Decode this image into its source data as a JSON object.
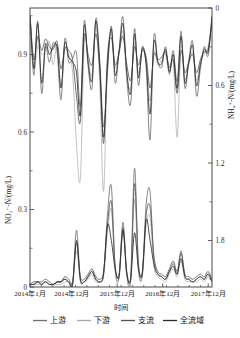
{
  "chart_data": {
    "type": "line",
    "title": "",
    "xlabel": "时间",
    "ylabel_left": "NO₂⁻-N/(mg/L)",
    "ylabel_right": "NH₄⁺-N/(mg/L)",
    "grid": false,
    "legend_position": "bottom",
    "x_tick_labels": [
      "2014年1月",
      "2014年12月",
      "2015年12月",
      "2016年12月",
      "2017年12月"
    ],
    "x_tick_positions": [
      0,
      11,
      23,
      35,
      47
    ],
    "xlim": [
      0,
      48
    ],
    "left_axis": {
      "label": "NO₂⁻-N/(mg/L)",
      "ticks": [
        0,
        0.3,
        0.6,
        0.9
      ],
      "tick_labels": [
        "0",
        "0.3",
        "0.6",
        "0.9"
      ],
      "lim": [
        0,
        1.08
      ],
      "inverted": false
    },
    "right_axis": {
      "label": "NH₄⁺-N/(mg/L)",
      "ticks": [
        0,
        0.6,
        1.2,
        1.8
      ],
      "tick_labels": [
        "0",
        "0.6",
        "1.2",
        "1.8"
      ],
      "lim": [
        0,
        2.16
      ],
      "inverted": true
    },
    "series": [
      {
        "name": "上游",
        "color": "#6f6f6f",
        "axis": "right",
        "values": [
          0.07,
          0.52,
          0.1,
          0.66,
          0.3,
          0.42,
          0.27,
          0.34,
          0.71,
          0.24,
          0.42,
          0.39,
          0.35,
          0.76,
          0.1,
          0.45,
          0.62,
          0.08,
          0.4,
          0.92,
          0.5,
          0.14,
          0.58,
          0.33,
          0.07,
          0.55,
          0.74,
          0.16,
          0.6,
          0.3,
          0.46,
          1.02,
          0.22,
          0.41,
          0.46,
          0.3,
          0.49,
          0.33,
          0.57,
          0.18,
          0.62,
          0.41,
          0.26,
          0.68,
          0.47,
          0.3,
          0.37,
          0.06
        ]
      },
      {
        "name": "下游",
        "color": "#a8a8a8",
        "axis": "right",
        "values": [
          0.05,
          0.46,
          0.3,
          0.36,
          0.33,
          0.26,
          0.44,
          0.28,
          0.6,
          0.33,
          0.36,
          0.5,
          1.05,
          1.32,
          0.28,
          0.4,
          0.52,
          0.14,
          0.58,
          1.42,
          0.4,
          0.2,
          0.46,
          0.36,
          0.18,
          0.52,
          0.62,
          0.27,
          0.5,
          0.34,
          0.4,
          0.72,
          0.34,
          0.44,
          0.4,
          0.36,
          0.52,
          0.42,
          1.0,
          0.3,
          0.55,
          0.44,
          0.34,
          0.56,
          0.42,
          0.36,
          0.3,
          0.1
        ]
      },
      {
        "name": "支流",
        "color": "#555555",
        "axis": "right",
        "values": [
          0.06,
          0.4,
          0.22,
          0.33,
          0.24,
          0.3,
          0.32,
          0.26,
          0.47,
          0.31,
          0.33,
          0.4,
          0.68,
          0.88,
          0.22,
          0.36,
          0.44,
          0.2,
          0.47,
          1.05,
          0.38,
          0.23,
          0.44,
          0.34,
          0.22,
          0.44,
          0.56,
          0.3,
          0.44,
          0.33,
          0.38,
          0.62,
          0.36,
          0.4,
          0.38,
          0.34,
          0.46,
          0.4,
          0.66,
          0.33,
          0.5,
          0.42,
          0.36,
          0.5,
          0.4,
          0.34,
          0.32,
          0.12
        ]
      },
      {
        "name": "全流域",
        "color": "#2a2a2a",
        "axis": "right",
        "values": [
          0.06,
          0.47,
          0.12,
          0.58,
          0.28,
          0.36,
          0.3,
          0.3,
          0.62,
          0.27,
          0.38,
          0.42,
          0.5,
          0.83,
          0.14,
          0.42,
          0.56,
          0.1,
          0.44,
          1.0,
          0.45,
          0.16,
          0.52,
          0.34,
          0.12,
          0.5,
          0.66,
          0.2,
          0.54,
          0.31,
          0.43,
          0.82,
          0.26,
          0.42,
          0.43,
          0.32,
          0.5,
          0.36,
          0.62,
          0.22,
          0.58,
          0.42,
          0.29,
          0.6,
          0.44,
          0.32,
          0.34,
          0.07
        ]
      },
      {
        "name": "上游",
        "color": "#6f6f6f",
        "axis": "left",
        "values": [
          0.01,
          0.01,
          0.02,
          0.01,
          0.02,
          0.01,
          0.01,
          0.02,
          0.02,
          0.03,
          0.02,
          0.01,
          0.22,
          0.03,
          0.02,
          0.04,
          0.06,
          0.03,
          0.02,
          0.05,
          0.28,
          0.39,
          0.07,
          0.04,
          0.25,
          0.05,
          0.03,
          0.46,
          0.08,
          0.05,
          0.32,
          0.37,
          0.1,
          0.05,
          0.04,
          0.03,
          0.06,
          0.09,
          0.05,
          0.14,
          0.04,
          0.03,
          0.02,
          0.03,
          0.04,
          0.03,
          0.05,
          0.02
        ]
      },
      {
        "name": "下游",
        "color": "#a8a8a8",
        "axis": "left",
        "values": [
          0.01,
          0.01,
          0.01,
          0.01,
          0.02,
          0.01,
          0.01,
          0.01,
          0.01,
          0.02,
          0.02,
          0.01,
          0.14,
          0.02,
          0.02,
          0.03,
          0.05,
          0.02,
          0.02,
          0.04,
          0.21,
          0.3,
          0.06,
          0.03,
          0.21,
          0.04,
          0.02,
          0.34,
          0.06,
          0.04,
          0.24,
          0.27,
          0.08,
          0.04,
          0.03,
          0.02,
          0.05,
          0.07,
          0.04,
          0.1,
          0.03,
          0.02,
          0.02,
          0.02,
          0.03,
          0.02,
          0.04,
          0.02
        ]
      },
      {
        "name": "支流",
        "color": "#555555",
        "axis": "left",
        "values": [
          0.01,
          0.02,
          0.02,
          0.02,
          0.03,
          0.02,
          0.01,
          0.02,
          0.02,
          0.04,
          0.03,
          0.02,
          0.17,
          0.04,
          0.03,
          0.05,
          0.07,
          0.04,
          0.03,
          0.06,
          0.24,
          0.33,
          0.08,
          0.05,
          0.23,
          0.06,
          0.04,
          0.4,
          0.09,
          0.06,
          0.28,
          0.31,
          0.12,
          0.06,
          0.05,
          0.04,
          0.07,
          0.1,
          0.06,
          0.13,
          0.05,
          0.04,
          0.03,
          0.04,
          0.05,
          0.04,
          0.06,
          0.03
        ]
      },
      {
        "name": "全流域",
        "color": "#2a2a2a",
        "axis": "left",
        "values": [
          0.01,
          0.01,
          0.02,
          0.01,
          0.02,
          0.01,
          0.01,
          0.02,
          0.02,
          0.03,
          0.02,
          0.01,
          0.18,
          0.03,
          0.02,
          0.04,
          0.06,
          0.03,
          0.02,
          0.05,
          0.24,
          0.18,
          0.07,
          0.04,
          0.22,
          0.05,
          0.03,
          0.21,
          0.07,
          0.05,
          0.26,
          0.18,
          0.09,
          0.05,
          0.04,
          0.03,
          0.06,
          0.08,
          0.05,
          0.11,
          0.04,
          0.03,
          0.02,
          0.03,
          0.04,
          0.03,
          0.05,
          0.02
        ]
      }
    ],
    "legend": [
      {
        "label": "上游",
        "color": "#6f6f6f"
      },
      {
        "label": "下游",
        "color": "#a8a8a8"
      },
      {
        "label": "支流",
        "color": "#555555"
      },
      {
        "label": "全流域",
        "color": "#2a2a2a"
      }
    ]
  }
}
